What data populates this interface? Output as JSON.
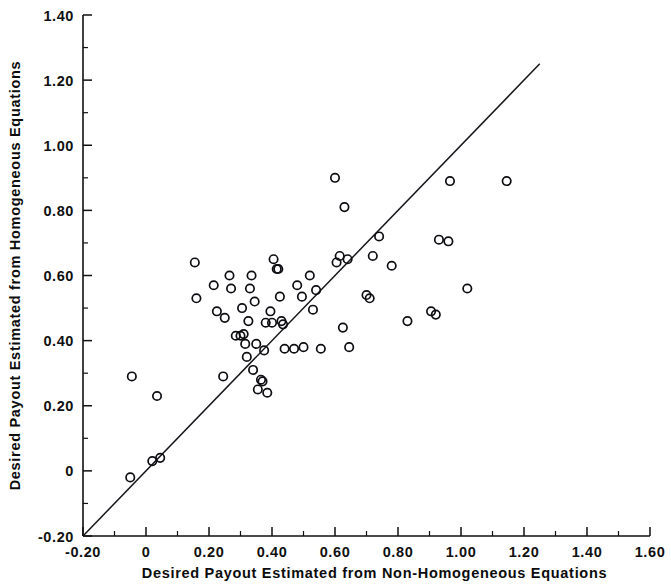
{
  "figure": {
    "background_color": "#ffffff",
    "ink_color": "#101010"
  },
  "chart_data": {
    "type": "scatter",
    "title": "",
    "subtitle": "",
    "xlabel": "Desired Payout Estimated from Non-Homogeneous Equations",
    "ylabel": "Desired Payout Estimated from Homogeneous Equations",
    "xlim": [
      -0.2,
      1.6
    ],
    "ylim": [
      -0.2,
      1.4
    ],
    "xticks": [
      -0.2,
      0,
      0.2,
      0.4,
      0.6,
      0.8,
      1.0,
      1.2,
      1.4,
      1.6
    ],
    "yticks": [
      -0.2,
      0,
      0.2,
      0.4,
      0.6,
      0.8,
      1.0,
      1.2,
      1.4
    ],
    "xticklabels": [
      "-0.20",
      "0",
      "0.20",
      "0.40",
      "0.60",
      "0.80",
      "1.00",
      "1.20",
      "1.40",
      "1.60"
    ],
    "yticklabels": [
      "-0.20",
      "0",
      "0.20",
      "0.40",
      "0.60",
      "0.80",
      "1.00",
      "1.20",
      "1.40"
    ],
    "minor_tick_interval": 0.1,
    "grid": false,
    "legend": null,
    "legend_position": "none",
    "marker_style": "open-circle",
    "marker_radius_px": 4.2,
    "reference_line": {
      "name": "identity-line",
      "type": "line",
      "equation": "y = x",
      "x_start": -0.2,
      "y_start": -0.2,
      "x_end": 1.25,
      "y_end": 1.25
    },
    "points": [
      [
        -0.05,
        -0.02
      ],
      [
        0.02,
        0.03
      ],
      [
        0.045,
        0.04
      ],
      [
        -0.045,
        0.29
      ],
      [
        0.035,
        0.23
      ],
      [
        0.155,
        0.64
      ],
      [
        0.16,
        0.53
      ],
      [
        0.215,
        0.57
      ],
      [
        0.225,
        0.49
      ],
      [
        0.245,
        0.29
      ],
      [
        0.25,
        0.47
      ],
      [
        0.265,
        0.6
      ],
      [
        0.27,
        0.56
      ],
      [
        0.285,
        0.415
      ],
      [
        0.3,
        0.415
      ],
      [
        0.31,
        0.42
      ],
      [
        0.305,
        0.5
      ],
      [
        0.315,
        0.39
      ],
      [
        0.32,
        0.35
      ],
      [
        0.325,
        0.46
      ],
      [
        0.33,
        0.56
      ],
      [
        0.335,
        0.6
      ],
      [
        0.34,
        0.31
      ],
      [
        0.345,
        0.52
      ],
      [
        0.35,
        0.39
      ],
      [
        0.355,
        0.25
      ],
      [
        0.365,
        0.28
      ],
      [
        0.37,
        0.275
      ],
      [
        0.375,
        0.37
      ],
      [
        0.38,
        0.455
      ],
      [
        0.385,
        0.24
      ],
      [
        0.395,
        0.49
      ],
      [
        0.4,
        0.455
      ],
      [
        0.405,
        0.65
      ],
      [
        0.415,
        0.62
      ],
      [
        0.42,
        0.62
      ],
      [
        0.425,
        0.535
      ],
      [
        0.43,
        0.46
      ],
      [
        0.435,
        0.45
      ],
      [
        0.44,
        0.375
      ],
      [
        0.47,
        0.375
      ],
      [
        0.48,
        0.57
      ],
      [
        0.495,
        0.535
      ],
      [
        0.5,
        0.38
      ],
      [
        0.52,
        0.6
      ],
      [
        0.53,
        0.495
      ],
      [
        0.54,
        0.555
      ],
      [
        0.555,
        0.375
      ],
      [
        0.6,
        0.9
      ],
      [
        0.605,
        0.64
      ],
      [
        0.615,
        0.66
      ],
      [
        0.625,
        0.44
      ],
      [
        0.63,
        0.81
      ],
      [
        0.64,
        0.65
      ],
      [
        0.645,
        0.38
      ],
      [
        0.7,
        0.54
      ],
      [
        0.71,
        0.53
      ],
      [
        0.72,
        0.66
      ],
      [
        0.74,
        0.72
      ],
      [
        0.78,
        0.63
      ],
      [
        0.83,
        0.46
      ],
      [
        0.905,
        0.49
      ],
      [
        0.92,
        0.48
      ],
      [
        0.93,
        0.71
      ],
      [
        0.96,
        0.705
      ],
      [
        0.965,
        0.89
      ],
      [
        1.02,
        0.56
      ],
      [
        1.145,
        0.89
      ]
    ]
  }
}
